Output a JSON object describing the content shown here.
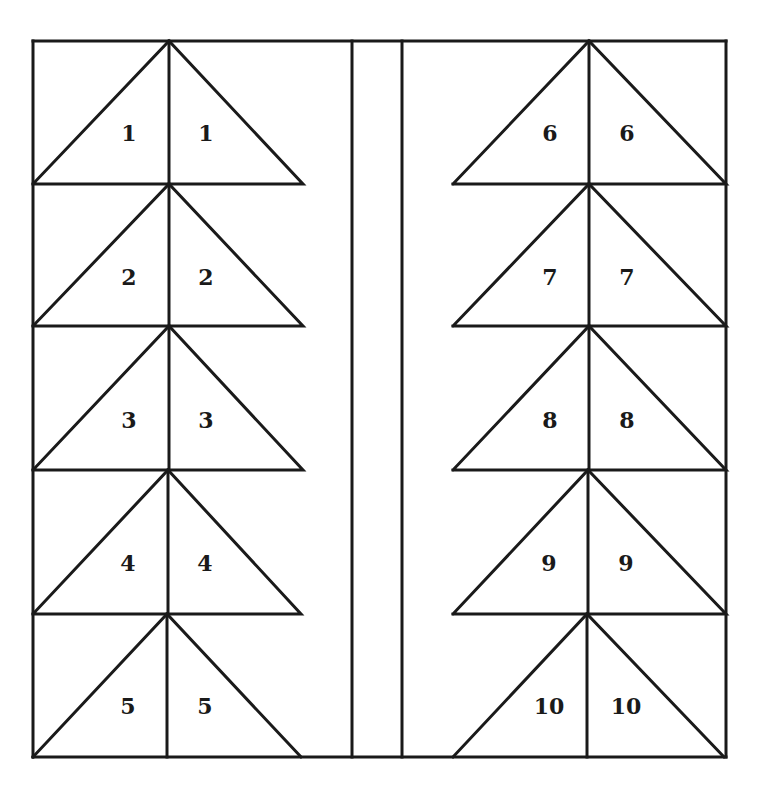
{
  "diagram": {
    "type": "triangle-pattern-template",
    "stroke_color": "#1a1a1a",
    "background": "#ffffff",
    "columns": [
      {
        "side": "left",
        "rows": [
          {
            "left_label": "1",
            "right_label": "1"
          },
          {
            "left_label": "2",
            "right_label": "2"
          },
          {
            "left_label": "3",
            "right_label": "3"
          },
          {
            "left_label": "4",
            "right_label": "4"
          },
          {
            "left_label": "5",
            "right_label": "5"
          }
        ]
      },
      {
        "side": "right",
        "rows": [
          {
            "left_label": "6",
            "right_label": "6"
          },
          {
            "left_label": "7",
            "right_label": "7"
          },
          {
            "left_label": "8",
            "right_label": "8"
          },
          {
            "left_label": "9",
            "right_label": "9"
          },
          {
            "left_label": "10",
            "right_label": "10"
          }
        ]
      }
    ]
  }
}
